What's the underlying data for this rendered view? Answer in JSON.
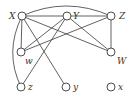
{
  "diagram": {
    "type": "graph",
    "nodes": [
      {
        "id": "X",
        "label": "X",
        "cx": 22,
        "cy": 16,
        "lx": 9,
        "ly": 19
      },
      {
        "id": "Y",
        "label": "Y",
        "cx": 67,
        "cy": 16,
        "lx": 73,
        "ly": 19
      },
      {
        "id": "Z",
        "label": "Z",
        "cx": 111,
        "cy": 16,
        "lx": 119,
        "ly": 19
      },
      {
        "id": "w",
        "label": "w",
        "cx": 21,
        "cy": 52,
        "lx": 25,
        "ly": 64
      },
      {
        "id": "W",
        "label": "W",
        "cx": 111,
        "cy": 52,
        "lx": 117,
        "ly": 64
      },
      {
        "id": "z",
        "label": "z",
        "cx": 21,
        "cy": 87,
        "lx": 28,
        "ly": 90
      },
      {
        "id": "y",
        "label": "y",
        "cx": 66,
        "cy": 87,
        "lx": 73,
        "ly": 90
      },
      {
        "id": "x",
        "label": "x",
        "cx": 111,
        "cy": 87,
        "lx": 118,
        "ly": 90
      }
    ],
    "edges": [
      {
        "from": "X",
        "to": "Y",
        "shape": "straight"
      },
      {
        "from": "Y",
        "to": "Z",
        "shape": "straight"
      },
      {
        "from": "X",
        "to": "Z",
        "shape": "arc-top"
      },
      {
        "from": "X",
        "to": "z",
        "shape": "arc-left"
      },
      {
        "from": "X",
        "to": "w",
        "shape": "straight"
      },
      {
        "from": "X",
        "to": "W",
        "shape": "straight"
      },
      {
        "from": "X",
        "to": "y",
        "shape": "straight"
      },
      {
        "from": "Y",
        "to": "w",
        "shape": "straight"
      },
      {
        "from": "Y",
        "to": "z",
        "shape": "straight"
      },
      {
        "from": "Y",
        "to": "W",
        "shape": "straight"
      },
      {
        "from": "Z",
        "to": "w",
        "shape": "straight"
      },
      {
        "from": "Z",
        "to": "W",
        "shape": "straight"
      }
    ]
  }
}
